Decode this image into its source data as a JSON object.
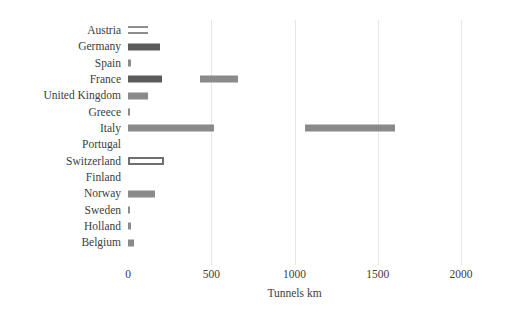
{
  "chart_data": {
    "type": "bar",
    "orientation": "horizontal",
    "title": "",
    "xlabel": "Tunnels km",
    "ylabel": "",
    "xlim": [
      0,
      2000
    ],
    "xticks": [
      0,
      500,
      1000,
      1500,
      2000
    ],
    "xtick_labels": [
      "0",
      "500",
      "1000",
      "1500",
      "2000"
    ],
    "grid": "vertical-light",
    "legend": "none",
    "categories": [
      "Austria",
      "Germany",
      "Spain",
      "France",
      "United Kingdom",
      "Greece",
      "Italy",
      "Portugal",
      "Switzerland",
      "Finland",
      "Norway",
      "Sweden",
      "Holland",
      "Belgium"
    ],
    "values": [
      120,
      192,
      20,
      205,
      120,
      12,
      517,
      0,
      216,
      0,
      162,
      12,
      18,
      36
    ],
    "segments": [
      {
        "category": "Austria",
        "start": 0,
        "end": 120,
        "style": "light"
      },
      {
        "category": "Germany",
        "start": 0,
        "end": 192,
        "style": "dark"
      },
      {
        "category": "Spain",
        "start": 0,
        "end": 20,
        "style": "mid"
      },
      {
        "category": "France",
        "start": 0,
        "end": 205,
        "style": "dark"
      },
      {
        "category": "France",
        "start": 432,
        "end": 661,
        "style": "mid"
      },
      {
        "category": "United Kingdom",
        "start": 0,
        "end": 120,
        "style": "mid"
      },
      {
        "category": "Greece",
        "start": 0,
        "end": 12,
        "style": "mid"
      },
      {
        "category": "Italy",
        "start": 0,
        "end": 517,
        "style": "mid"
      },
      {
        "category": "Italy",
        "start": 1063,
        "end": 1604,
        "style": "mid"
      },
      {
        "category": "Switzerland",
        "start": 0,
        "end": 216,
        "style": "outlined"
      },
      {
        "category": "Norway",
        "start": 0,
        "end": 162,
        "style": "mid"
      },
      {
        "category": "Sweden",
        "start": 0,
        "end": 12,
        "style": "mid"
      },
      {
        "category": "Holland",
        "start": 0,
        "end": 18,
        "style": "mid"
      },
      {
        "category": "Belgium",
        "start": 0,
        "end": 36,
        "style": "mid"
      }
    ],
    "colors": {
      "bar_dark": "#5b5b5b",
      "bar_mid": "#8a8a8a",
      "bar_outline": "#6f6f6f",
      "gridline": "#e6e6e6",
      "text": "#3d3d3d",
      "background": "#ffffff"
    }
  }
}
